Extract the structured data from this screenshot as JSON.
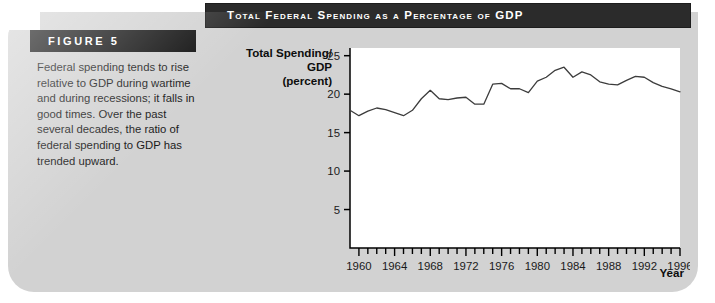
{
  "figure": {
    "label": "FIGURE 5",
    "title": "Total Federal Spending as a Percentage of GDP",
    "caption": "Federal spending tends to rise relative to GDP during wartime and during recessions; it falls in good times. Over the past several decades, the ratio of federal spending to GDP has trended upward."
  },
  "colors": {
    "panel_background": "#d2d2d2",
    "title_bar": "#2b2b2b",
    "figure_bar": "#111111",
    "plot_background": "#ffffff",
    "line": "#3c3c3c",
    "axis": "#000000",
    "text": "#1a1a1a"
  },
  "chart_data": {
    "type": "line",
    "title": "Total Federal Spending as a Percentage of GDP",
    "xlabel": "Year",
    "ylabel": "Total Spending/ GDP (percent)",
    "ylabel_lines": [
      "Total Spending/",
      "GDP",
      "(percent)"
    ],
    "xlim": [
      1959,
      1996
    ],
    "ylim": [
      0,
      26
    ],
    "yticks": [
      5,
      10,
      15,
      20,
      25
    ],
    "xticks": [
      1960,
      1964,
      1968,
      1972,
      1976,
      1980,
      1984,
      1988,
      1992,
      1996
    ],
    "x_minor_tick_interval": 1,
    "grid": false,
    "legend": false,
    "x": [
      1959,
      1960,
      1961,
      1962,
      1963,
      1964,
      1965,
      1966,
      1967,
      1968,
      1969,
      1970,
      1971,
      1972,
      1973,
      1974,
      1975,
      1976,
      1977,
      1978,
      1979,
      1980,
      1981,
      1982,
      1983,
      1984,
      1985,
      1986,
      1987,
      1988,
      1989,
      1990,
      1991,
      1992,
      1993,
      1994,
      1995,
      1996
    ],
    "series": [
      {
        "name": "Total Spending/GDP",
        "values": [
          17.9,
          17.2,
          17.8,
          18.2,
          18.0,
          17.6,
          17.2,
          17.9,
          19.4,
          20.5,
          19.4,
          19.3,
          19.5,
          19.6,
          18.7,
          18.7,
          21.3,
          21.4,
          20.7,
          20.7,
          20.2,
          21.7,
          22.2,
          23.1,
          23.5,
          22.2,
          22.9,
          22.5,
          21.6,
          21.3,
          21.2,
          21.8,
          22.3,
          22.2,
          21.5,
          21.0,
          20.7,
          20.3
        ]
      }
    ]
  }
}
